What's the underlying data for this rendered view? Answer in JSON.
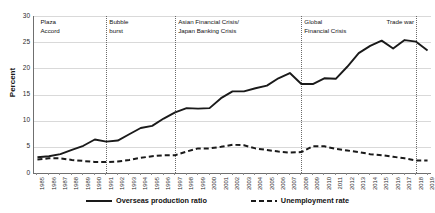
{
  "chart_data": {
    "type": "line",
    "title": "",
    "xlabel": "",
    "ylabel": "Percent",
    "ylim": [
      0,
      30
    ],
    "yticks": [
      0,
      5,
      10,
      15,
      20,
      25,
      30
    ],
    "grid": true,
    "legend_position": "bottom",
    "x": [
      1985,
      1986,
      1987,
      1988,
      1989,
      1990,
      1991,
      1992,
      1993,
      1994,
      1995,
      1996,
      1997,
      1998,
      1999,
      2000,
      2001,
      2002,
      2003,
      2004,
      2005,
      2006,
      2007,
      2008,
      2009,
      2010,
      2011,
      2012,
      2013,
      2014,
      2015,
      2016,
      2017,
      2018,
      2019
    ],
    "series": [
      {
        "name": "Overseas production ratio",
        "style": "solid",
        "color": "#1a1a1a",
        "values": [
          3.0,
          3.2,
          3.6,
          4.4,
          5.2,
          6.4,
          6.0,
          6.2,
          7.4,
          8.6,
          9.0,
          10.4,
          11.6,
          12.4,
          12.3,
          12.4,
          14.3,
          15.6,
          15.6,
          16.2,
          16.7,
          18.1,
          19.1,
          17.0,
          17.0,
          18.1,
          18.0,
          20.3,
          22.9,
          24.3,
          25.3,
          23.8,
          25.4,
          25.1,
          23.4
        ]
      },
      {
        "name": "Unemployment rate",
        "style": "dashed",
        "color": "#1a1a1a",
        "values": [
          2.6,
          2.8,
          2.8,
          2.5,
          2.3,
          2.1,
          2.1,
          2.2,
          2.5,
          2.9,
          3.2,
          3.4,
          3.4,
          4.1,
          4.7,
          4.7,
          5.0,
          5.4,
          5.3,
          4.7,
          4.4,
          4.1,
          3.9,
          4.0,
          5.1,
          5.1,
          4.6,
          4.3,
          4.0,
          3.6,
          3.4,
          3.1,
          2.8,
          2.4,
          2.4
        ]
      }
    ],
    "annotations": [
      {
        "label": "Plaza\nAccord",
        "x_year": 1985,
        "align": "left"
      },
      {
        "label": "Bubble\nburst",
        "x_year": 1991,
        "align": "left"
      },
      {
        "label": "Asian Financial Crisis/\nJapan Banking Crisis",
        "x_year": 1997,
        "align": "left"
      },
      {
        "label": "Global\nFinancial Crisis",
        "x_year": 2008,
        "align": "left"
      },
      {
        "label": "Trade war",
        "x_year": 2018,
        "align": "right"
      }
    ],
    "dividers": [
      1991,
      1997,
      2008,
      2018
    ]
  },
  "legend": {
    "items": [
      {
        "label": "Overseas production ratio",
        "style": "solid"
      },
      {
        "label": "Unemployment rate",
        "style": "dashed"
      }
    ]
  }
}
